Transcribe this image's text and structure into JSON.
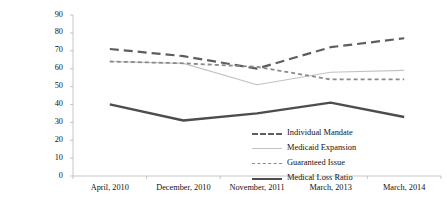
{
  "chart_data": {
    "type": "line",
    "title": "",
    "xlabel": "",
    "ylabel": "Percent of Respondents Correctly Identifying Provision",
    "categories": [
      "April, 2010",
      "December, 2010",
      "November, 2011",
      "March, 2013",
      "March, 2014"
    ],
    "ylim": [
      0,
      90
    ],
    "yticks": [
      0,
      10,
      20,
      30,
      40,
      50,
      60,
      70,
      80,
      90
    ],
    "grid": false,
    "legend_position": "bottom-right",
    "series": [
      {
        "name": "Individual Mandate",
        "values": [
          71,
          67,
          60,
          72,
          77
        ],
        "color": "#5e5e5e",
        "style": "dashed-thick"
      },
      {
        "name": "Medicaid Expansion",
        "values": [
          64,
          63,
          51,
          58,
          59
        ],
        "color": "#c2c2c2",
        "style": "solid-thin"
      },
      {
        "name": "Guaranteed Issue",
        "values": [
          64,
          63,
          61,
          54,
          54
        ],
        "color": "#8a8a8a",
        "style": "dashed-medium"
      },
      {
        "name": "Medical Loss Ratio",
        "values": [
          40,
          31,
          35,
          41,
          33
        ],
        "color": "#4d4d4d",
        "style": "solid-thick"
      }
    ]
  },
  "axis": {
    "y_title": "Percent of Respondents Correctly\nIdentifying Provision",
    "y_tick_labels": [
      "90",
      "80",
      "70",
      "60",
      "50",
      "40",
      "30",
      "20",
      "10",
      "0"
    ],
    "x_tick_labels": [
      "April, 2010",
      "December, 2010",
      "November, 2011",
      "March, 2013",
      "March, 2014"
    ]
  },
  "legend": {
    "items": [
      {
        "label": "Individual Mandate"
      },
      {
        "label": "Medicaid Expansion"
      },
      {
        "label": "Guaranteed Issue"
      },
      {
        "label": "Medical Loss Ratio"
      }
    ]
  }
}
